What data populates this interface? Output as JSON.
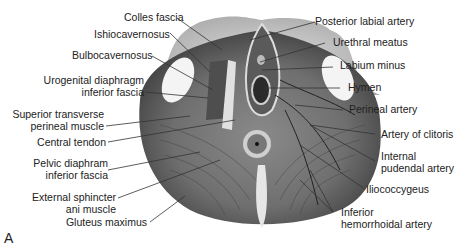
{
  "figure": {
    "panel_letter": "A",
    "left_labels": [
      {
        "id": "colles",
        "text": "Colles fascia"
      },
      {
        "id": "ischio",
        "text": "Ishiocavernosus"
      },
      {
        "id": "bulbo",
        "text": "Bulbocavernosus"
      },
      {
        "id": "urogen1",
        "text": "Urogenital diaphragm"
      },
      {
        "id": "urogen2",
        "text": "inferior fascia"
      },
      {
        "id": "suptrans1",
        "text": "Superior transverse"
      },
      {
        "id": "suptrans2",
        "text": "perineal muscle"
      },
      {
        "id": "central",
        "text": "Central tendon"
      },
      {
        "id": "pelvic1",
        "text": "Pelvic diaphram"
      },
      {
        "id": "pelvic2",
        "text": "inferior fascia"
      },
      {
        "id": "extsph1",
        "text": "External sphincter"
      },
      {
        "id": "extsph2",
        "text": "ani muscle"
      },
      {
        "id": "gluteus",
        "text": "Gluteus maximus"
      }
    ],
    "right_labels": [
      {
        "id": "postlab",
        "text": "Posterior labial artery"
      },
      {
        "id": "urethral",
        "text": "Urethral meatus"
      },
      {
        "id": "labium",
        "text": "Labium minus"
      },
      {
        "id": "hymen",
        "text": "Hymen"
      },
      {
        "id": "perineal",
        "text": "Perineal artery"
      },
      {
        "id": "clitoris",
        "text": "Artery of clitoris"
      },
      {
        "id": "intpud1",
        "text": "Internal"
      },
      {
        "id": "intpud2",
        "text": "pudendal artery"
      },
      {
        "id": "ilio",
        "text": "Iliococcygeus"
      },
      {
        "id": "infhem1",
        "text": "Inferior"
      },
      {
        "id": "infhem2",
        "text": "hemorrhoidal artery"
      }
    ]
  }
}
